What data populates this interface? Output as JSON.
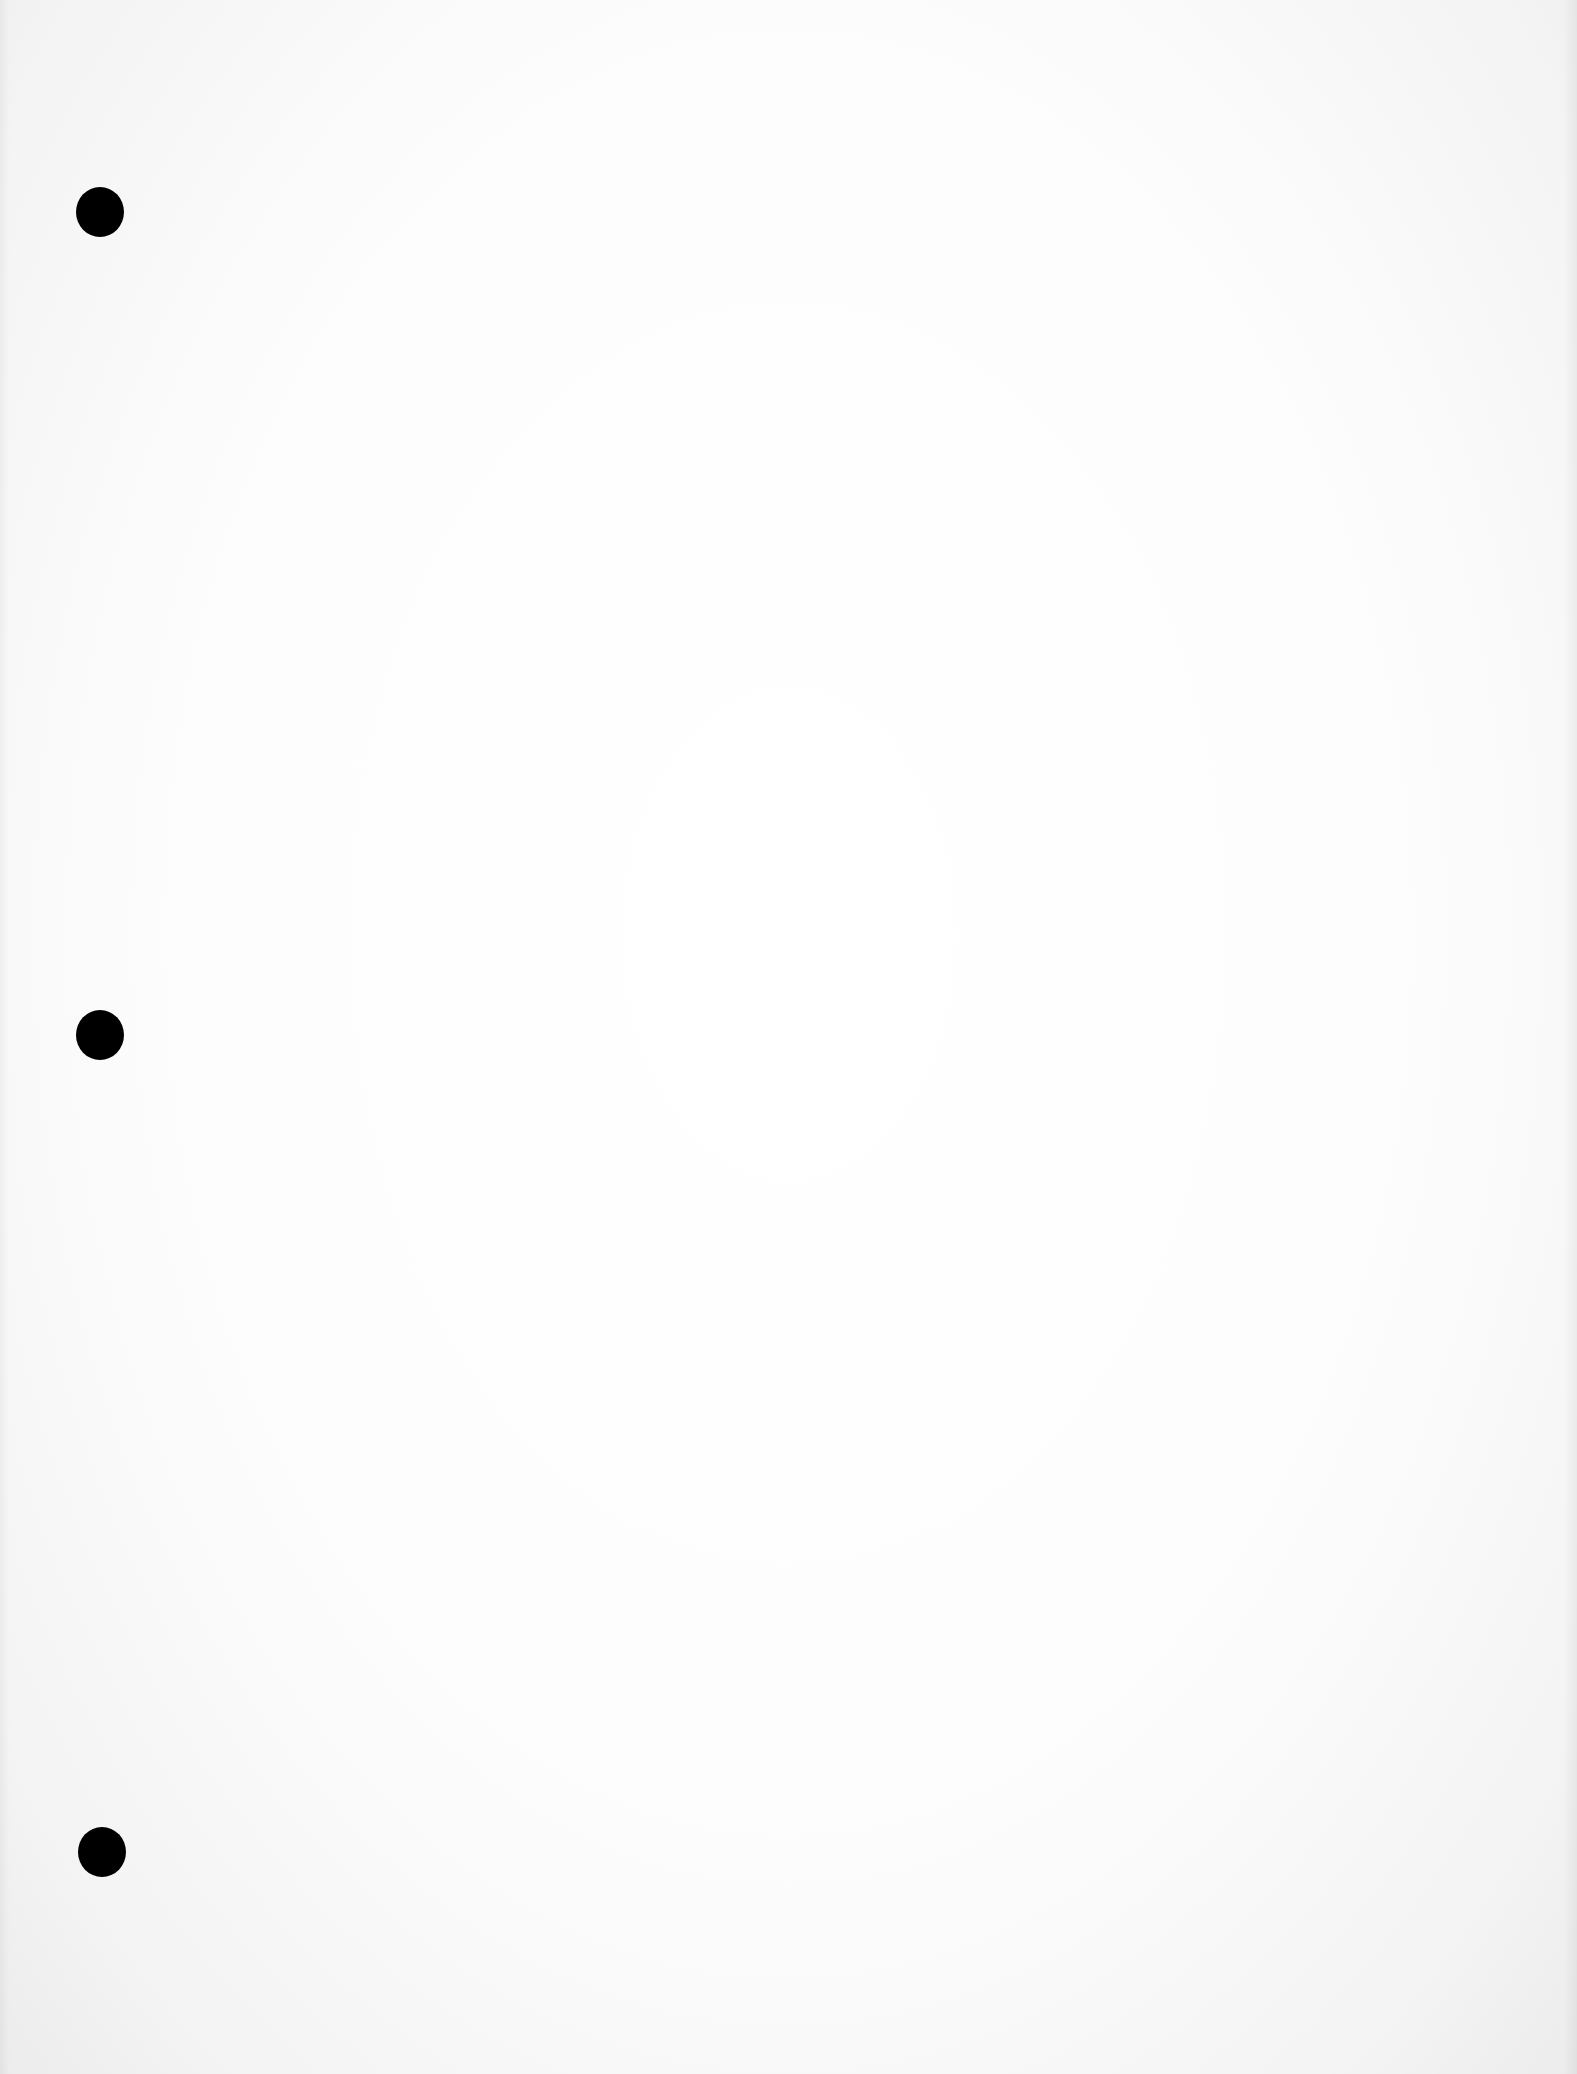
{
  "page": {
    "type": "blank scanned sheet",
    "background_color": "#fdfdfd",
    "text": ""
  },
  "punch_holes": [
    {
      "id": "top",
      "cx": 100,
      "cy": 212,
      "color": "#000000"
    },
    {
      "id": "middle",
      "cx": 100,
      "cy": 1035,
      "color": "#000000"
    },
    {
      "id": "bottom",
      "cx": 102,
      "cy": 1852,
      "color": "#000000"
    }
  ]
}
